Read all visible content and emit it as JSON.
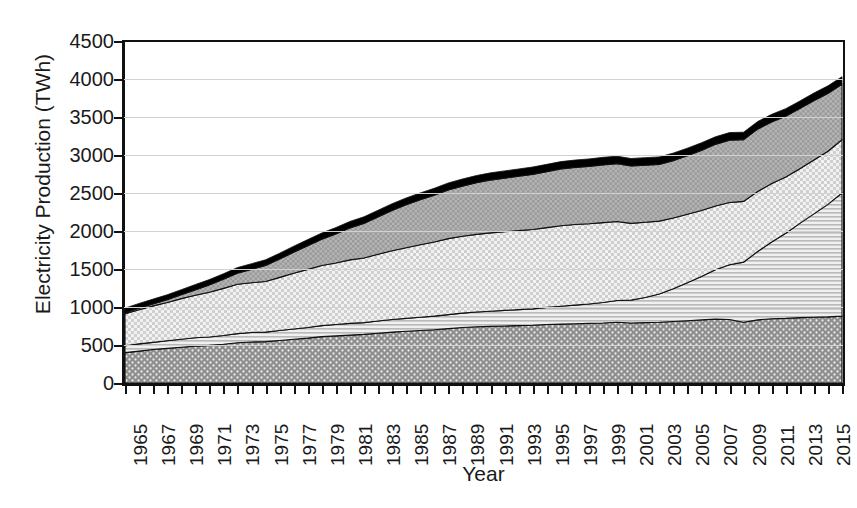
{
  "axes": {
    "ylabel": "Electricity Production (TWh)",
    "xlabel": "Year",
    "yticks": [
      "0",
      "500",
      "1000",
      "1500",
      "2000",
      "2500",
      "3000",
      "3500",
      "4000",
      "4500"
    ],
    "ylim": [
      0,
      4500
    ],
    "ystep": 500,
    "xticks": [
      "1965",
      "1967",
      "1969",
      "1971",
      "1973",
      "1975",
      "1977",
      "1979",
      "1981",
      "1983",
      "1985",
      "1987",
      "1989",
      "1991",
      "1993",
      "1995",
      "1997",
      "1999",
      "2001",
      "2003",
      "2005",
      "2007",
      "2009",
      "2011",
      "2013",
      "2015"
    ],
    "xlim": [
      1965,
      2016
    ],
    "grid": true,
    "legend": "none"
  },
  "colors": {
    "layer1": "#8e8e8e",
    "layer2": "#d8d8d8",
    "layer3": "#e8e8e8",
    "layer4": "#b4b4b4",
    "layer5": "#000000",
    "gridline": "#d2d2d2",
    "axis": "#111111",
    "background": "#ffffff"
  },
  "chart_data": {
    "type": "area",
    "title": "",
    "subtitle": "",
    "xlabel": "Year",
    "ylabel": "Electricity Production (TWh)",
    "ylim": [
      0,
      4500
    ],
    "xlim": [
      1965,
      2016
    ],
    "grid": true,
    "stacked": true,
    "legend_position": "none",
    "x": [
      1965,
      1966,
      1967,
      1968,
      1969,
      1970,
      1971,
      1972,
      1973,
      1974,
      1975,
      1976,
      1977,
      1978,
      1979,
      1980,
      1981,
      1982,
      1983,
      1984,
      1985,
      1986,
      1987,
      1988,
      1989,
      1990,
      1991,
      1992,
      1993,
      1994,
      1995,
      1996,
      1997,
      1998,
      1999,
      2000,
      2001,
      2002,
      2003,
      2004,
      2005,
      2006,
      2007,
      2008,
      2009,
      2010,
      2011,
      2012,
      2013,
      2014,
      2015,
      2016
    ],
    "series": [
      {
        "name": "layer-1-bottom",
        "pattern": "dotted-dark-gray",
        "values": [
          400,
          420,
          440,
          455,
          470,
          485,
          495,
          510,
          530,
          540,
          545,
          560,
          575,
          590,
          610,
          620,
          630,
          640,
          655,
          670,
          680,
          690,
          700,
          715,
          730,
          740,
          745,
          750,
          755,
          760,
          770,
          775,
          780,
          785,
          790,
          800,
          790,
          795,
          800,
          810,
          820,
          830,
          840,
          835,
          800,
          830,
          845,
          850,
          860,
          865,
          870,
          880
        ]
      },
      {
        "name": "layer-2",
        "pattern": "horizontal-stripes-light",
        "values": [
          90,
          95,
          95,
          100,
          105,
          110,
          110,
          115,
          120,
          125,
          125,
          130,
          135,
          140,
          145,
          150,
          155,
          155,
          160,
          165,
          170,
          175,
          180,
          185,
          190,
          195,
          200,
          205,
          210,
          215,
          225,
          235,
          245,
          255,
          270,
          285,
          300,
          330,
          370,
          430,
          500,
          570,
          650,
          720,
          790,
          900,
          1010,
          1120,
          1240,
          1360,
          1480,
          1620
        ]
      },
      {
        "name": "layer-3",
        "pattern": "checkered-light",
        "values": [
          420,
          450,
          480,
          505,
          535,
          560,
          590,
          620,
          650,
          655,
          665,
          700,
          735,
          765,
          790,
          810,
          835,
          850,
          880,
          905,
          930,
          955,
          975,
          1000,
          1010,
          1020,
          1030,
          1035,
          1040,
          1045,
          1050,
          1060,
          1060,
          1055,
          1050,
          1040,
          1010,
          990,
          960,
          930,
          900,
          870,
          840,
          820,
          800,
          790,
          770,
          740,
          720,
          710,
          700,
          700
        ]
      },
      {
        "name": "layer-4",
        "pattern": "dotted-medium-gray",
        "values": [
          15,
          20,
          25,
          35,
          50,
          70,
          95,
          120,
          145,
          175,
          210,
          240,
          275,
          310,
          345,
          380,
          420,
          455,
          490,
          530,
          565,
          590,
          615,
          640,
          660,
          680,
          695,
          705,
          715,
          725,
          735,
          745,
          750,
          755,
          760,
          760,
          755,
          750,
          745,
          755,
          770,
          790,
          810,
          820,
          810,
          820,
          810,
          800,
          790,
          780,
          760,
          730
        ]
      },
      {
        "name": "layer-5-top",
        "pattern": "solid-black",
        "values": [
          60,
          62,
          64,
          66,
          68,
          70,
          71,
          72,
          74,
          75,
          76,
          78,
          80,
          82,
          84,
          85,
          86,
          87,
          88,
          89,
          90,
          91,
          92,
          93,
          94,
          95,
          95,
          96,
          96,
          97,
          97,
          98,
          98,
          98,
          99,
          99,
          99,
          100,
          100,
          100,
          100,
          100,
          100,
          100,
          100,
          100,
          100,
          100,
          100,
          100,
          100,
          100
        ]
      }
    ]
  }
}
